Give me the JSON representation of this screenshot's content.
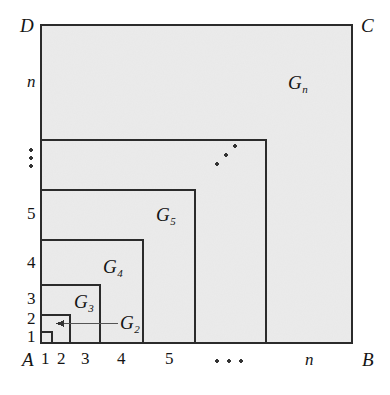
{
  "figure": {
    "type": "geometric-diagram",
    "background_color": "#ffffff",
    "fill_color": "#ebebeb",
    "line_color": "#2b2b2b",
    "canvas": {
      "width": 390,
      "height": 395
    }
  },
  "corners": {
    "top_left": "D",
    "top_right": "C",
    "bottom_left": "A",
    "bottom_right": "B"
  },
  "axes": {
    "x_ticks": [
      "1",
      "2",
      "3",
      "4",
      "5"
    ],
    "x_ellipsis": "···",
    "x_last": "n",
    "y_ticks": [
      "1",
      "2",
      "3",
      "4",
      "5"
    ],
    "y_ellipsis": "⋮",
    "y_last": "n"
  },
  "region_labels": [
    {
      "base": "G",
      "sub": "2"
    },
    {
      "base": "G",
      "sub": "3"
    },
    {
      "base": "G",
      "sub": "4"
    },
    {
      "base": "G",
      "sub": "5"
    },
    {
      "base": "G",
      "sub": "n"
    }
  ],
  "interior_ellipsis": "⋰",
  "annotation": {
    "arrow_label_base": "G",
    "arrow_label_sub": "2",
    "arrow_direction": "left",
    "arrow_from_x": 118,
    "arrow_to_x": 56,
    "arrow_y": 323
  },
  "geometry": {
    "outer": {
      "x0": 41,
      "y0": 25,
      "x1": 352,
      "y1": 343
    },
    "x_grid": [
      41,
      52,
      70,
      100,
      143,
      195,
      266,
      352
    ],
    "y_grid": [
      343,
      333,
      315,
      285,
      240,
      190,
      140,
      25
    ],
    "nested_squares": [
      {
        "name": "G1",
        "x0": 41,
        "y0": 333,
        "x1": 52,
        "y1": 343
      },
      {
        "name": "G2",
        "x0": 41,
        "y0": 315,
        "x1": 70,
        "y1": 343
      },
      {
        "name": "G3",
        "x0": 41,
        "y0": 285,
        "x1": 100,
        "y1": 343
      },
      {
        "name": "G4",
        "x0": 41,
        "y0": 240,
        "x1": 143,
        "y1": 343
      },
      {
        "name": "G5",
        "x0": 41,
        "y0": 190,
        "x1": 195,
        "y1": 343
      },
      {
        "name": "Gn-1",
        "x0": 41,
        "y0": 140,
        "x1": 266,
        "y1": 343
      },
      {
        "name": "Gn",
        "x0": 41,
        "y0": 25,
        "x1": 352,
        "y1": 343
      }
    ]
  }
}
